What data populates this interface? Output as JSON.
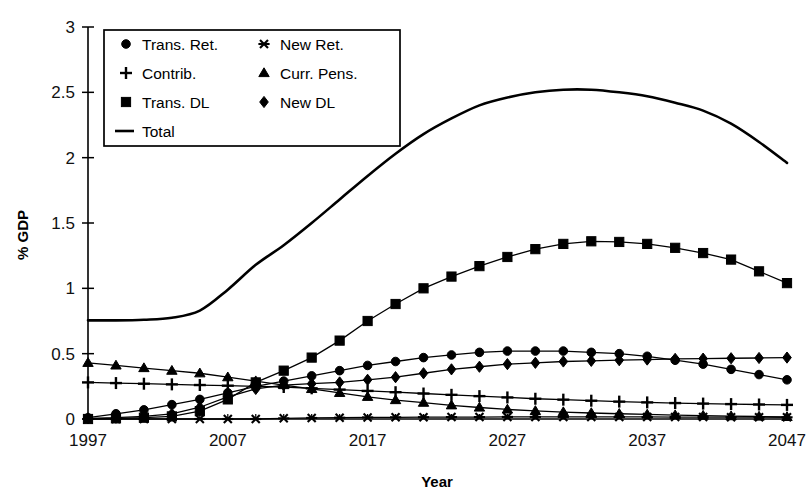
{
  "chart_data": {
    "type": "line",
    "title": "",
    "xlabel": "Year",
    "ylabel": "% GDP",
    "xlim": [
      1997,
      2047
    ],
    "ylim": [
      0,
      3
    ],
    "yticks": [
      0,
      0.5,
      1,
      1.5,
      2,
      2.5,
      3
    ],
    "ytick_labels": [
      "0",
      "0.5",
      "1",
      "1.5",
      "2",
      "2.5",
      "3"
    ],
    "xticks": [
      1997,
      2007,
      2017,
      2027,
      2037,
      2047
    ],
    "xtick_labels": [
      "1997",
      "2007",
      "2017",
      "2027",
      "2037",
      "2047"
    ],
    "x": [
      1997,
      1999,
      2001,
      2003,
      2005,
      2007,
      2009,
      2011,
      2013,
      2015,
      2017,
      2019,
      2021,
      2023,
      2025,
      2027,
      2029,
      2031,
      2033,
      2035,
      2037,
      2039,
      2041,
      2043,
      2045,
      2047
    ],
    "grid": false,
    "legend_position": "upper-left-inside",
    "marker_interval_years": 2,
    "series": [
      {
        "name": "Trans. Ret.",
        "marker": "circle",
        "values": [
          0.01,
          0.04,
          0.07,
          0.11,
          0.15,
          0.2,
          0.25,
          0.29,
          0.33,
          0.37,
          0.41,
          0.44,
          0.47,
          0.49,
          0.51,
          0.52,
          0.52,
          0.52,
          0.51,
          0.5,
          0.48,
          0.45,
          0.42,
          0.38,
          0.34,
          0.3
        ]
      },
      {
        "name": "Contrib.",
        "marker": "plus",
        "values": [
          0.28,
          0.275,
          0.27,
          0.265,
          0.26,
          0.255,
          0.25,
          0.245,
          0.235,
          0.225,
          0.215,
          0.205,
          0.195,
          0.185,
          0.175,
          0.165,
          0.155,
          0.148,
          0.14,
          0.133,
          0.127,
          0.122,
          0.118,
          0.114,
          0.111,
          0.108
        ]
      },
      {
        "name": "Trans. DL",
        "marker": "square",
        "values": [
          0.0,
          0.005,
          0.01,
          0.02,
          0.06,
          0.15,
          0.28,
          0.37,
          0.47,
          0.6,
          0.75,
          0.88,
          1.0,
          1.09,
          1.17,
          1.24,
          1.3,
          1.34,
          1.36,
          1.355,
          1.34,
          1.31,
          1.27,
          1.22,
          1.13,
          1.04
        ]
      },
      {
        "name": "New Ret.",
        "marker": "star",
        "values": [
          0.0,
          0.0,
          0.0,
          0.0,
          0.0,
          0.0,
          0.0,
          0.005,
          0.008,
          0.01,
          0.012,
          0.013,
          0.014,
          0.015,
          0.015,
          0.016,
          0.016,
          0.016,
          0.016,
          0.016,
          0.016,
          0.015,
          0.015,
          0.014,
          0.014,
          0.013
        ]
      },
      {
        "name": "Curr. Pens.",
        "marker": "triangle",
        "values": [
          0.43,
          0.41,
          0.39,
          0.37,
          0.35,
          0.32,
          0.29,
          0.26,
          0.23,
          0.2,
          0.17,
          0.145,
          0.125,
          0.105,
          0.088,
          0.073,
          0.062,
          0.053,
          0.046,
          0.04,
          0.035,
          0.03,
          0.026,
          0.022,
          0.019,
          0.016
        ]
      },
      {
        "name": "New  DL",
        "marker": "diamond",
        "values": [
          0.005,
          0.01,
          0.02,
          0.04,
          0.09,
          0.17,
          0.23,
          0.26,
          0.27,
          0.28,
          0.3,
          0.32,
          0.35,
          0.38,
          0.4,
          0.42,
          0.43,
          0.44,
          0.445,
          0.45,
          0.455,
          0.46,
          0.462,
          0.465,
          0.467,
          0.47
        ]
      },
      {
        "name": "Total",
        "marker": "line",
        "values": [
          0.755,
          0.755,
          0.76,
          0.775,
          0.83,
          0.99,
          1.18,
          1.33,
          1.5,
          1.68,
          1.86,
          2.03,
          2.18,
          2.3,
          2.4,
          2.46,
          2.5,
          2.52,
          2.52,
          2.5,
          2.47,
          2.42,
          2.36,
          2.26,
          2.12,
          1.96
        ]
      }
    ]
  },
  "legend": {
    "entries": [
      {
        "label": "Trans. Ret.",
        "marker": "circle"
      },
      {
        "label": "New Ret.",
        "marker": "star"
      },
      {
        "label": "Contrib.",
        "marker": "plus"
      },
      {
        "label": "Curr. Pens.",
        "marker": "triangle"
      },
      {
        "label": "Trans. DL",
        "marker": "square"
      },
      {
        "label": "New  DL",
        "marker": "diamond"
      },
      {
        "label": "Total",
        "marker": "line"
      }
    ]
  },
  "colors": {
    "ink": "#000000",
    "background": "#ffffff"
  }
}
